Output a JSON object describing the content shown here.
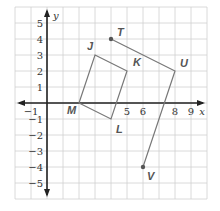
{
  "diagram": {
    "type": "coordinate-plane",
    "grid": {
      "x_min": -2,
      "x_max": 10,
      "y_min": -6,
      "y_max": 6,
      "unit_px": 16,
      "origin_px": [
        47,
        103
      ]
    },
    "axes": {
      "x_label": "x",
      "y_label": "y",
      "x_ticks": [
        {
          "value": -1,
          "label": "−1"
        },
        {
          "value": 5,
          "label": "5"
        },
        {
          "value": 6,
          "label": "6"
        },
        {
          "value": 8,
          "label": "8"
        },
        {
          "value": 9,
          "label": "9"
        }
      ],
      "y_ticks": [
        {
          "value": 5,
          "label": "5"
        },
        {
          "value": 4,
          "label": "4"
        },
        {
          "value": 3,
          "label": "3"
        },
        {
          "value": 2,
          "label": "2"
        },
        {
          "value": 1,
          "label": "1"
        },
        {
          "value": -1,
          "label": "−1"
        },
        {
          "value": -2,
          "label": "−2"
        },
        {
          "value": -3,
          "label": "−3"
        },
        {
          "value": -4,
          "label": "−4"
        },
        {
          "value": -5,
          "label": "−5"
        }
      ]
    },
    "shapes": [
      {
        "name": "quadrilateral-JKLM",
        "vertices": [
          {
            "label": "J",
            "x": 3,
            "y": 3
          },
          {
            "label": "K",
            "x": 5,
            "y": 2
          },
          {
            "label": "L",
            "x": 4,
            "y": -1
          },
          {
            "label": "M",
            "x": 2,
            "y": 0
          }
        ],
        "closed": true
      },
      {
        "name": "path-TUV",
        "vertices": [
          {
            "label": "T",
            "x": 4,
            "y": 4
          },
          {
            "label": "U",
            "x": 8,
            "y": 2
          },
          {
            "label": "V",
            "x": 6,
            "y": -4
          }
        ],
        "closed": false,
        "endpoint_dots": [
          "T",
          "V"
        ]
      }
    ],
    "colors": {
      "grid": "#d0d0d0",
      "axis": "#222222",
      "shape": "#777777",
      "label": "#555555"
    }
  }
}
